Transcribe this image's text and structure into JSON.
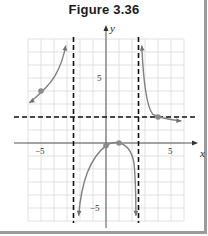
{
  "figure": {
    "title": "Figure 3.36"
  },
  "chart_data": {
    "type": "line",
    "title": "Figure 3.36",
    "xlabel": "x",
    "ylabel": "y",
    "xlim": [
      -6,
      6
    ],
    "ylim": [
      -6,
      8
    ],
    "grid": true,
    "x_tick_labels": [
      {
        "value": -5,
        "label": "−5"
      },
      {
        "value": 5,
        "label": "5"
      }
    ],
    "y_tick_labels": [
      {
        "value": 5,
        "label": "5"
      },
      {
        "value": -5,
        "label": "−5"
      }
    ],
    "asymptotes": {
      "vertical": [
        -2.5,
        2.5
      ],
      "horizontal": [
        2
      ]
    },
    "branches": [
      {
        "name": "left-branch",
        "x_range": [
          -6,
          -3
        ],
        "behavior": "increases toward +infinity approaching x=-2.5 from left; approaches y=2 as x→-infinity"
      },
      {
        "name": "middle-branch",
        "x_range": [
          -2.3,
          2.4
        ],
        "behavior": "rises from -infinity near x=-2.5, peaks near (1,0), falls to -infinity near x=2.5"
      },
      {
        "name": "right-branch",
        "x_range": [
          2.6,
          6
        ],
        "behavior": "falls from +infinity near x=2.5, approaches y=2 from above"
      }
    ],
    "marked_points": [
      {
        "x": -5,
        "y": 4
      },
      {
        "x": 0,
        "y": -0.2
      },
      {
        "x": 1,
        "y": 0
      },
      {
        "x": 4,
        "y": 2
      }
    ]
  }
}
